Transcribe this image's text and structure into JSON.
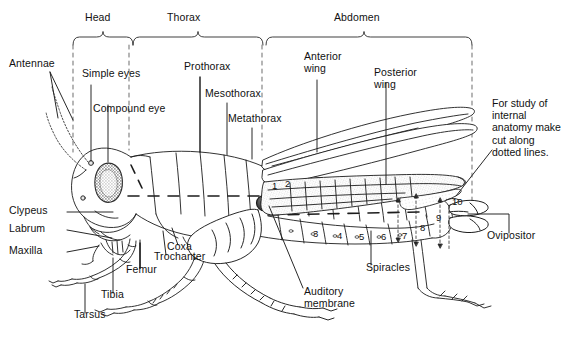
{
  "figure": {
    "background_color": "#ffffff",
    "line_color": "#1a1a1a",
    "text_color": "#111111"
  },
  "regions": [
    {
      "name": "head",
      "label": "Head"
    },
    {
      "name": "thorax",
      "label": "Thorax"
    },
    {
      "name": "abdomen",
      "label": "Abdomen"
    }
  ],
  "labels": {
    "antennae": "Antennae",
    "simple_eyes": "Simple eyes",
    "compound_eye": "Compound eye",
    "prothorax": "Prothorax",
    "mesothorax": "Mesothorax",
    "metathorax": "Metathorax",
    "anterior_wing": "Anterior\nwing",
    "posterior_wing": "Posterior\nwing",
    "clypeus": "Clypeus",
    "labrum": "Labrum",
    "maxilla": "Maxilla",
    "coxa": "Coxa",
    "trochanter": "Trochanter",
    "femur": "Femur",
    "tibia": "Tibia",
    "tarsus": "Tarsus",
    "auditory_membrane": "Auditory\nmembrane",
    "spiracles": "Spiracles",
    "ovipositor": "Ovipositor"
  },
  "note": {
    "text": "For study of\ninternal\nanatomy make\ncut along\ndotted lines."
  },
  "segment_numbers": [
    "1",
    "2",
    "3",
    "4",
    "5",
    "6",
    "7",
    "8",
    "9",
    "10"
  ]
}
